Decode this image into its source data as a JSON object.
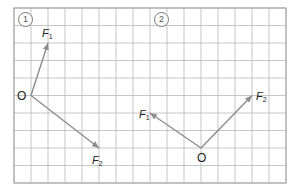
{
  "grid": {
    "x0": 14,
    "y0": 8,
    "cols": 16,
    "rows": 10,
    "cell_w": 17,
    "cell_h": 17.5,
    "line_color": "#b8b8b8",
    "border_color": "#a0a0a0"
  },
  "vector_color": "#8c8c8c",
  "panels": [
    {
      "number": "1",
      "number_pos": [
        18,
        12
      ],
      "origin": {
        "label": "O",
        "grid": [
          1,
          5
        ]
      },
      "vectors": [
        {
          "name": "F",
          "sub": "1",
          "tip_grid": [
            2,
            2
          ],
          "label_pos": [
            42,
            28
          ]
        },
        {
          "name": "F",
          "sub": "2",
          "tip_grid": [
            5,
            8
          ],
          "label_pos": [
            92,
            155
          ]
        }
      ]
    },
    {
      "number": "2",
      "number_pos": [
        154,
        12
      ],
      "origin": {
        "label": "O",
        "grid": [
          11,
          8
        ]
      },
      "vectors": [
        {
          "name": "F",
          "sub": "1",
          "tip_grid": [
            8,
            6
          ],
          "label_pos": [
            139,
            109
          ]
        },
        {
          "name": "F",
          "sub": "2",
          "tip_grid": [
            14,
            5
          ],
          "label_pos": [
            256,
            91
          ]
        }
      ]
    }
  ]
}
